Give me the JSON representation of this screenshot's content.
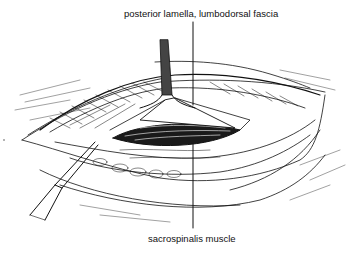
{
  "labels": {
    "top": "posterior lamella, lumbodorsal fascia",
    "bottom": "sacrospinalis muscle"
  },
  "illustration": {
    "subject": "surgical-incision-lumbar-region",
    "instruments": [
      "retractor-top",
      "forceps-left"
    ],
    "ink_color": "#111111",
    "background": "#ffffff"
  }
}
